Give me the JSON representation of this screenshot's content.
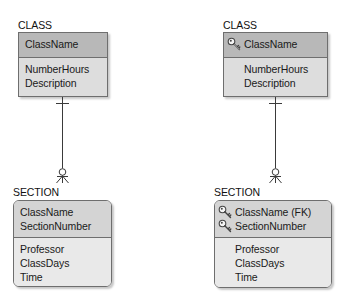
{
  "diagram": {
    "type": "ER diagram (crow's foot notation)",
    "colors": {
      "strong_entity_header": "#b8b8b8",
      "strong_entity_body": "#dddddd",
      "weak_entity_header": "#d4d4d4",
      "weak_entity_body": "#e9e9e9",
      "border": "#6e6e6e",
      "line": "#3a3a3a"
    },
    "left": {
      "class": {
        "title": "CLASS",
        "primary_key": [
          {
            "name": "ClassName",
            "key_icon": false
          }
        ],
        "attributes": [
          "NumberHours",
          "Description"
        ]
      },
      "section": {
        "title": "SECTION",
        "primary_key": [
          {
            "name": "ClassName",
            "key_icon": false
          },
          {
            "name": "SectionNumber",
            "key_icon": false
          }
        ],
        "attributes": [
          "Professor",
          "ClassDays",
          "Time"
        ]
      },
      "relationship": {
        "from": "CLASS",
        "to": "SECTION",
        "parent_end": "exactly one (bar)",
        "child_end": "zero or many (circle + crow's foot)"
      }
    },
    "right": {
      "class": {
        "title": "CLASS",
        "primary_key": [
          {
            "name": "ClassName",
            "key_icon": true,
            "icon": "key-icon"
          }
        ],
        "attributes": [
          "NumberHours",
          "Description"
        ]
      },
      "section": {
        "title": "SECTION",
        "primary_key": [
          {
            "name": "ClassName (FK)",
            "key_icon": true,
            "icon": "key-icon"
          },
          {
            "name": "SectionNumber",
            "key_icon": true,
            "icon": "key-icon"
          }
        ],
        "attributes": [
          "Professor",
          "ClassDays",
          "Time"
        ]
      },
      "relationship": {
        "from": "CLASS",
        "to": "SECTION",
        "parent_end": "exactly one (bar)",
        "child_end": "zero or many (circle + crow's foot)"
      }
    }
  }
}
